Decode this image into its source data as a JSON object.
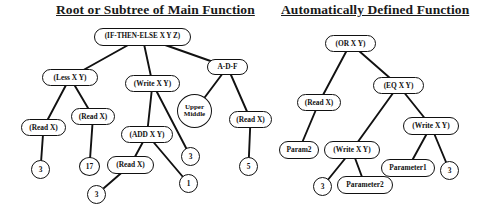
{
  "titles": [
    {
      "text": "Root or Subtree of Main Function",
      "x": 56,
      "y": 2,
      "w": 198
    },
    {
      "text": "Automatically Defined Function",
      "x": 281,
      "y": 2,
      "w": 176
    }
  ],
  "diagram": {
    "type": "tree-diagram",
    "background": "#ffffff",
    "node_fill": "#ffffff",
    "stroke": "#111111",
    "trees": [
      {
        "name": "main-function-tree",
        "title": "Root or Subtree of Main Function",
        "nodes": [
          {
            "id": "m_root",
            "label": "(IF-THEN-ELSE X Y Z)",
            "shape": "rounded",
            "x": 94,
            "y": 28,
            "w": 97,
            "h": 18,
            "font": 7.2
          },
          {
            "id": "m_less",
            "label": "(Less X Y)",
            "shape": "rounded",
            "x": 42,
            "y": 69,
            "w": 56,
            "h": 17,
            "font": 7.4
          },
          {
            "id": "m_write",
            "label": "(Write X Y)",
            "shape": "rounded",
            "x": 125,
            "y": 75,
            "w": 55,
            "h": 17,
            "font": 7.4
          },
          {
            "id": "m_adf",
            "label": "A-D-F",
            "shape": "rounded",
            "x": 207,
            "y": 59,
            "w": 41,
            "h": 16,
            "font": 7.4
          },
          {
            "id": "m_read1",
            "label": "(Read X)",
            "shape": "rounded",
            "x": 21,
            "y": 119,
            "w": 45,
            "h": 17,
            "font": 7.4
          },
          {
            "id": "m_read2",
            "label": "(Read X)",
            "shape": "rounded",
            "x": 71,
            "y": 108,
            "w": 44,
            "h": 17,
            "font": 7.4
          },
          {
            "id": "m_add",
            "label": "(ADD X Y)",
            "shape": "rounded",
            "x": 121,
            "y": 126,
            "w": 52,
            "h": 17,
            "font": 7.4
          },
          {
            "id": "m_upmid",
            "label": "Upper Middle",
            "shape": "ellipse",
            "x": 177,
            "y": 94,
            "w": 35,
            "h": 34,
            "font": 7.0
          },
          {
            "id": "m_read3",
            "label": "(Read X)",
            "shape": "rounded",
            "x": 229,
            "y": 111,
            "w": 43,
            "h": 17,
            "font": 7.4
          },
          {
            "id": "m_three1",
            "label": "3",
            "shape": "circle",
            "x": 31,
            "y": 160,
            "w": 19,
            "h": 19,
            "font": 7.4
          },
          {
            "id": "m_17",
            "label": "17",
            "shape": "circle",
            "x": 79,
            "y": 157,
            "w": 21,
            "h": 19,
            "font": 7.4
          },
          {
            "id": "m_read4",
            "label": "(Read X)",
            "shape": "rounded",
            "x": 107,
            "y": 156,
            "w": 47,
            "h": 18,
            "font": 7.4
          },
          {
            "id": "m_three2",
            "label": "3",
            "shape": "circle",
            "x": 181,
            "y": 147,
            "w": 19,
            "h": 19,
            "font": 7.4
          },
          {
            "id": "m_one",
            "label": "1",
            "shape": "circle",
            "x": 179,
            "y": 174,
            "w": 19,
            "h": 19,
            "font": 7.4
          },
          {
            "id": "m_three3",
            "label": "3",
            "shape": "circle",
            "x": 87,
            "y": 185,
            "w": 19,
            "h": 19,
            "font": 7.4
          },
          {
            "id": "m_five",
            "label": "5",
            "shape": "circle",
            "x": 239,
            "y": 157,
            "w": 19,
            "h": 19,
            "font": 7.4
          }
        ],
        "edges": [
          [
            "m_root",
            "m_less"
          ],
          [
            "m_root",
            "m_write"
          ],
          [
            "m_root",
            "m_adf"
          ],
          [
            "m_less",
            "m_read1"
          ],
          [
            "m_less",
            "m_read2"
          ],
          [
            "m_write",
            "m_add"
          ],
          [
            "m_write",
            "m_three2"
          ],
          [
            "m_adf",
            "m_upmid"
          ],
          [
            "m_adf",
            "m_read3"
          ],
          [
            "m_read1",
            "m_three1"
          ],
          [
            "m_read2",
            "m_17"
          ],
          [
            "m_add",
            "m_read4"
          ],
          [
            "m_add",
            "m_one"
          ],
          [
            "m_read4",
            "m_three3"
          ],
          [
            "m_read3",
            "m_five"
          ]
        ]
      },
      {
        "name": "adf-tree",
        "title": "Automatically Defined Function",
        "nodes": [
          {
            "id": "a_or",
            "label": "(OR X Y)",
            "shape": "rounded",
            "x": 325,
            "y": 35,
            "w": 51,
            "h": 17,
            "font": 7.4
          },
          {
            "id": "a_read",
            "label": "(Read X)",
            "shape": "rounded",
            "x": 297,
            "y": 94,
            "w": 44,
            "h": 17,
            "font": 7.4
          },
          {
            "id": "a_eq",
            "label": "(EQ X Y)",
            "shape": "rounded",
            "x": 373,
            "y": 77,
            "w": 51,
            "h": 17,
            "font": 7.4
          },
          {
            "id": "a_param2",
            "label": "Param2",
            "shape": "rounded",
            "x": 279,
            "y": 141,
            "w": 40,
            "h": 18,
            "font": 7.4
          },
          {
            "id": "a_write1",
            "label": "(Write X Y)",
            "shape": "rounded",
            "x": 324,
            "y": 141,
            "w": 56,
            "h": 18,
            "font": 7.4
          },
          {
            "id": "a_write2",
            "label": "(Write X Y)",
            "shape": "rounded",
            "x": 403,
            "y": 117,
            "w": 56,
            "h": 18,
            "font": 7.4
          },
          {
            "id": "a_three1",
            "label": "3",
            "shape": "circle",
            "x": 313,
            "y": 177,
            "w": 19,
            "h": 19,
            "font": 7.4
          },
          {
            "id": "a_par2",
            "label": "Parameter2",
            "shape": "rounded",
            "x": 337,
            "y": 176,
            "w": 56,
            "h": 18,
            "font": 7.4
          },
          {
            "id": "a_par1",
            "label": "Parameter1",
            "shape": "rounded",
            "x": 381,
            "y": 159,
            "w": 54,
            "h": 18,
            "font": 7.4
          },
          {
            "id": "a_three2",
            "label": "3",
            "shape": "circle",
            "x": 440,
            "y": 161,
            "w": 19,
            "h": 19,
            "font": 7.4
          }
        ],
        "edges": [
          [
            "a_or",
            "a_read"
          ],
          [
            "a_or",
            "a_eq"
          ],
          [
            "a_read",
            "a_param2"
          ],
          [
            "a_eq",
            "a_write1"
          ],
          [
            "a_eq",
            "a_write2"
          ],
          [
            "a_write1",
            "a_three1"
          ],
          [
            "a_write1",
            "a_par2"
          ],
          [
            "a_write2",
            "a_par1"
          ],
          [
            "a_write2",
            "a_three2"
          ]
        ]
      }
    ]
  }
}
